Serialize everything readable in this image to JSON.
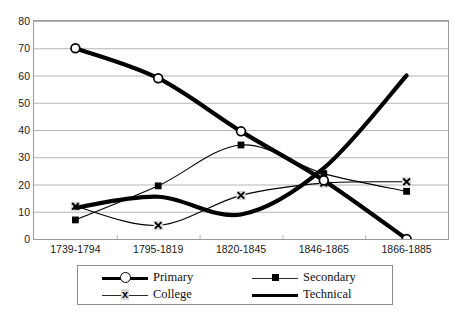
{
  "chart_data": {
    "type": "line",
    "title": "",
    "subtitle": "",
    "xlabel": "",
    "ylabel": "",
    "categories": [
      "1739-1794",
      "1795-1819",
      "1820-1845",
      "1846-1865",
      "1866-1885"
    ],
    "ylim": [
      0,
      80
    ],
    "ytick_step": 10,
    "yticks": [
      "80",
      "70",
      "60",
      "50",
      "40",
      "30",
      "20",
      "10",
      "0"
    ],
    "grid": "horizontal",
    "legend_position": "bottom",
    "smoothing": "spline",
    "series": [
      {
        "name": "Primary",
        "marker": "open-circle",
        "line_weight": "thick",
        "color": "#000000",
        "values": [
          70,
          59,
          39.5,
          21.5,
          0
        ]
      },
      {
        "name": "Secondary",
        "marker": "filled-square",
        "line_weight": "thin",
        "color": "#000000",
        "values": [
          7,
          19.5,
          34.5,
          24,
          17.5
        ]
      },
      {
        "name": "College",
        "marker": "x-cross",
        "line_weight": "thin",
        "color": "#000000",
        "values": [
          12,
          5,
          16,
          20.5,
          21
        ]
      },
      {
        "name": "Technical",
        "marker": "none",
        "line_weight": "thick",
        "color": "#000000",
        "values": [
          11.5,
          15.5,
          9,
          26,
          60
        ]
      }
    ]
  },
  "legend": {
    "entries": [
      {
        "label": "Primary"
      },
      {
        "label": "Secondary"
      },
      {
        "label": "College"
      },
      {
        "label": "Technical"
      }
    ]
  },
  "colors": {
    "plot_border": "#9a9a9a",
    "gridline": "#b5b5b5",
    "series_ink": "#000000",
    "marker_halo": "#d9d9d9",
    "background": "#ffffff"
  }
}
